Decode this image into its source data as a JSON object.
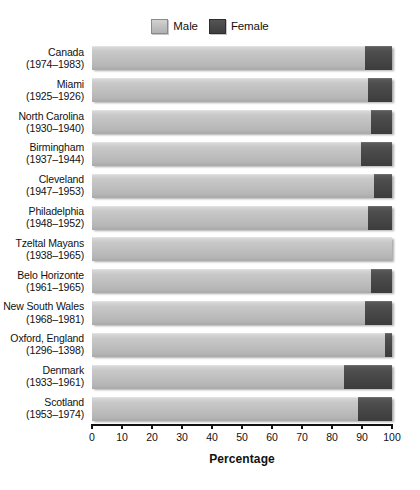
{
  "legend": {
    "position": "top-center",
    "entries": [
      {
        "label": "Male",
        "swatch": "male-swatch",
        "color": "#bebebe"
      },
      {
        "label": "Female",
        "swatch": "female-swatch",
        "color": "#454545"
      }
    ]
  },
  "axis": {
    "title": "Percentage",
    "ticks": [
      "0",
      "10",
      "20",
      "30",
      "40",
      "50",
      "60",
      "70",
      "80",
      "90",
      "100"
    ]
  },
  "chart_data": {
    "type": "bar",
    "orientation": "horizontal",
    "stacked": true,
    "stack_total": 100,
    "title": "",
    "subtitle": "",
    "xlabel": "Percentage",
    "ylabel": "",
    "xlim": [
      0,
      100
    ],
    "grid": false,
    "legend_position": "top-center",
    "categories": [
      "Canada (1974–1983)",
      "Miami (1925–1926)",
      "North Carolina (1930–1940)",
      "Birmingham (1937–1944)",
      "Cleveland (1947–1953)",
      "Philadelphia (1948–1952)",
      "Tzeltal Mayans (1938–1965)",
      "Belo Horizonte (1961–1965)",
      "New South Wales (1968–1981)",
      "Oxford, England (1296–1398)",
      "Denmark (1933–1961)",
      "Scotland (1953–1974)"
    ],
    "category_parts": [
      {
        "name": "Canada",
        "years": "(1974–1983)"
      },
      {
        "name": "Miami",
        "years": "(1925–1926)"
      },
      {
        "name": "North Carolina",
        "years": "(1930–1940)"
      },
      {
        "name": "Birmingham",
        "years": "(1937–1944)"
      },
      {
        "name": "Cleveland",
        "years": "(1947–1953)"
      },
      {
        "name": "Philadelphia",
        "years": "(1948–1952)"
      },
      {
        "name": "Tzeltal Mayans",
        "years": "(1938–1965)"
      },
      {
        "name": "Belo Horizonte",
        "years": "(1961–1965)"
      },
      {
        "name": "New South Wales",
        "years": "(1968–1981)"
      },
      {
        "name": "Oxford, England",
        "years": "(1296–1398)"
      },
      {
        "name": "Denmark",
        "years": "(1933–1961)"
      },
      {
        "name": "Scotland",
        "years": "(1953–1974)"
      }
    ],
    "series": [
      {
        "name": "Male",
        "color": "#bebebe",
        "values": [
          91,
          92,
          93,
          89.5,
          94,
          92,
          100,
          93,
          91,
          97.5,
          84,
          88.5
        ]
      },
      {
        "name": "Female",
        "color": "#454545",
        "values": [
          9,
          8,
          7,
          10.5,
          6,
          8,
          0,
          7,
          9,
          2.5,
          16,
          11.5
        ]
      }
    ]
  }
}
